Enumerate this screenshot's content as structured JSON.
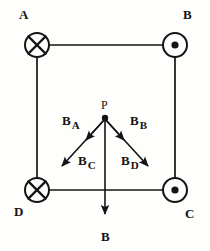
{
  "figure": {
    "stroke_color": "#141414",
    "background_color": "#fefefc",
    "square": {
      "left": 37,
      "top": 45,
      "right": 175,
      "bottom": 190
    },
    "corners": [
      {
        "id": "corner-a",
        "label": "A",
        "symbol": "cross",
        "symbol_name": "current-into-page-icon",
        "cx": 37,
        "cy": 45,
        "r": 12,
        "label_x": 19,
        "label_y": 8
      },
      {
        "id": "corner-b",
        "label": "B",
        "symbol": "dot",
        "symbol_name": "current-out-of-page-icon",
        "cx": 175,
        "cy": 45,
        "r": 12,
        "label_x": 183,
        "label_y": 8
      },
      {
        "id": "corner-c",
        "label": "C",
        "symbol": "dot",
        "symbol_name": "current-out-of-page-icon",
        "cx": 175,
        "cy": 190,
        "r": 12,
        "label_x": 185,
        "label_y": 207
      },
      {
        "id": "corner-d",
        "label": "D",
        "symbol": "cross",
        "symbol_name": "current-into-page-icon",
        "cx": 37,
        "cy": 190,
        "r": 12,
        "label_x": 14,
        "label_y": 205
      }
    ],
    "point_p": {
      "label": "P",
      "x": 105,
      "y": 118,
      "label_x": 101,
      "label_y": 99,
      "dot_r": 3.2
    },
    "vectors": [
      {
        "id": "vector-ba",
        "base": "B",
        "subscript": "A",
        "x1": 105,
        "y1": 119,
        "x2": 86,
        "y2": 140,
        "label_x": 62,
        "label_y": 112
      },
      {
        "id": "vector-bb",
        "base": "B",
        "subscript": "B",
        "x1": 105,
        "y1": 119,
        "x2": 124,
        "y2": 140,
        "label_x": 130,
        "label_y": 112
      },
      {
        "id": "vector-bc",
        "base": "B",
        "subscript": "C",
        "x1": 105,
        "y1": 119,
        "x2": 62,
        "y2": 166,
        "label_x": 78,
        "label_y": 152
      },
      {
        "id": "vector-bd",
        "base": "B",
        "subscript": "D",
        "x1": 105,
        "y1": 119,
        "x2": 148,
        "y2": 166,
        "label_x": 121,
        "label_y": 152
      },
      {
        "id": "vector-b-resultant",
        "base": "B",
        "subscript": "",
        "x1": 105,
        "y1": 119,
        "x2": 105,
        "y2": 214,
        "label_x": 101,
        "label_y": 228
      }
    ]
  }
}
